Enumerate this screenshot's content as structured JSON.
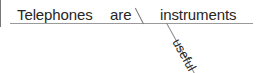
{
  "diagram": {
    "type": "reed-kellogg-sentence-diagram",
    "sentence": "Telephones are useful instruments.",
    "baseline_color": "#9a9a9a",
    "text_color": "#262626",
    "background": "#ffffff",
    "slots": {
      "subject": "Telephones",
      "verb": "are",
      "complement": "instruments",
      "modifier": "useful"
    },
    "dividers": {
      "subject_predicate": "vertical-bar",
      "verb_complement": "backslash-bar",
      "modifier_attachment": "diagonal-line"
    }
  }
}
